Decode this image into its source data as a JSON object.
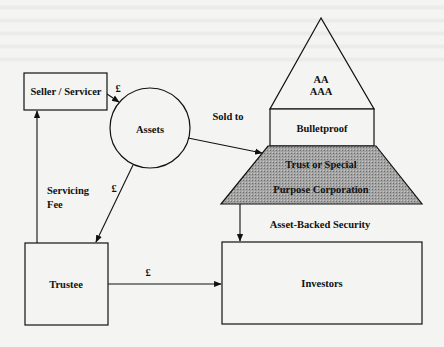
{
  "diagram": {
    "type": "securitisation-flow",
    "nodes": {
      "seller": {
        "label": "Seller / Servicer"
      },
      "assets": {
        "label": "Assets"
      },
      "rating_line1": {
        "label": "AA"
      },
      "rating_line2": {
        "label": "AAA"
      },
      "bulletproof": {
        "label": "Bulletproof"
      },
      "spv_line1": {
        "label": "Trust or Special"
      },
      "spv_line2": {
        "label": "Purpose Corporation"
      },
      "trustee": {
        "label": "Trustee"
      },
      "investors": {
        "label": "Investors"
      }
    },
    "edges": {
      "seller_to_assets": {
        "label": "£"
      },
      "assets_to_spv": {
        "label": "Sold to"
      },
      "assets_to_trustee": {
        "label": "£"
      },
      "trustee_to_seller_line1": {
        "label": "Servicing"
      },
      "trustee_to_seller_line2": {
        "label": "Fee"
      },
      "spv_to_investors": {
        "label": "Asset-Backed Security"
      },
      "trustee_to_investors": {
        "label": "£"
      }
    },
    "colors": {
      "background": "#f4f4f2",
      "line": "#111111",
      "spv_fill": "#9a9a9a"
    }
  }
}
